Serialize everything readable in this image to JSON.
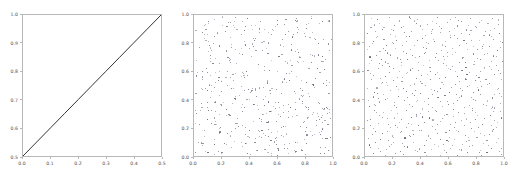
{
  "figure": {
    "background_color": "#ffffff",
    "axis_color": "#b8b8b8",
    "tick_label_color": "#4d4d4d",
    "width": 515,
    "height": 179
  },
  "chart_data": [
    {
      "type": "line",
      "panel_index": 0,
      "title": "",
      "xlabel": "",
      "ylabel": "",
      "xlim": [
        0.0,
        0.5
      ],
      "ylim": [
        0.5,
        1.0
      ],
      "grid": false,
      "legend": null,
      "xticks": [
        0.0,
        0.1,
        0.2,
        0.3,
        0.4,
        0.5
      ],
      "xticklabels": [
        "0.0",
        "0.1",
        "0.2",
        "0.3",
        "0.4",
        "0.5"
      ],
      "yticks": [
        0.5,
        0.6,
        0.7,
        0.8,
        0.9,
        1.0
      ],
      "yticklabels": [
        "0.5",
        "0.6",
        "0.7",
        "0.8",
        "0.9",
        "1.0"
      ],
      "series": [
        {
          "name": "running mean",
          "color": "#333333",
          "x": [
            0.0,
            0.05,
            0.1,
            0.15,
            0.2,
            0.25,
            0.3,
            0.35,
            0.4,
            0.45,
            0.5
          ],
          "y": [
            0.5,
            0.55,
            0.6,
            0.65,
            0.7,
            0.75,
            0.8,
            0.85,
            0.9,
            0.95,
            1.0
          ]
        }
      ]
    },
    {
      "type": "scatter",
      "panel_index": 1,
      "title": "",
      "xlabel": "",
      "ylabel": "",
      "xlim": [
        0.0,
        1.0
      ],
      "ylim": [
        0.0,
        1.0
      ],
      "grid": false,
      "legend": null,
      "marker_color": "#5a5a6e",
      "n_points": 500,
      "distribution": "pseudo-random uniform",
      "xticks": [
        0.0,
        0.2,
        0.4,
        0.6,
        0.8,
        1.0
      ],
      "xticklabels": [
        "0.0",
        "0.2",
        "0.4",
        "0.6",
        "0.8",
        "1.0"
      ],
      "yticks": [
        0.0,
        0.2,
        0.4,
        0.6,
        0.8,
        1.0
      ],
      "yticklabels": [
        "0.0",
        "0.2",
        "0.4",
        "0.6",
        "0.8",
        "1.0"
      ]
    },
    {
      "type": "scatter",
      "panel_index": 2,
      "title": "",
      "xlabel": "",
      "ylabel": "",
      "xlim": [
        0.0,
        1.0
      ],
      "ylim": [
        0.0,
        1.0
      ],
      "grid": false,
      "legend": null,
      "marker_color": "#5a5a6e",
      "n_points": 500,
      "distribution": "quasi-random low-discrepancy",
      "xticks": [
        0.0,
        0.2,
        0.4,
        0.6,
        0.8,
        1.0
      ],
      "xticklabels": [
        "0.0",
        "0.2",
        "0.4",
        "0.6",
        "0.8",
        "1.0"
      ],
      "yticks": [
        0.0,
        0.2,
        0.4,
        0.6,
        0.8,
        1.0
      ],
      "yticklabels": [
        "0.0",
        "0.2",
        "0.4",
        "0.6",
        "0.8",
        "1.0"
      ]
    }
  ]
}
